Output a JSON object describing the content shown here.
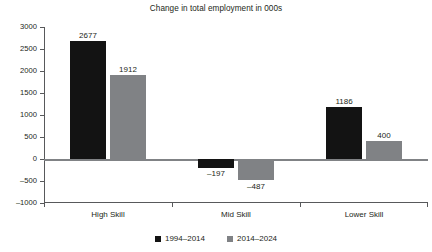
{
  "chart_data": {
    "type": "bar",
    "title": "Change in total employment in 000s",
    "xlabel": "",
    "ylabel": "",
    "categories": [
      "High Skill",
      "Mid Skill",
      "Lower Skill"
    ],
    "series": [
      {
        "name": "1994–2014",
        "color": "#131313",
        "values": [
          2677,
          -197,
          1186
        ]
      },
      {
        "name": "2014–2024",
        "color": "#808285",
        "values": [
          1912,
          -487,
          400
        ]
      }
    ],
    "value_labels": [
      [
        "2677",
        "1912"
      ],
      [
        "–197",
        "–487"
      ],
      [
        "1186",
        "400"
      ]
    ],
    "ylim": [
      -1000,
      3000
    ],
    "yticks": [
      3000,
      2500,
      2000,
      1500,
      1000,
      500,
      0,
      -500,
      -1000
    ],
    "ytick_labels": [
      "3000",
      "2500",
      "2000",
      "1500",
      "1000",
      "500",
      "0",
      "–500",
      "–1000"
    ],
    "grid": false,
    "legend_position": "bottom",
    "zero_line": true,
    "background": "#ffffff"
  }
}
